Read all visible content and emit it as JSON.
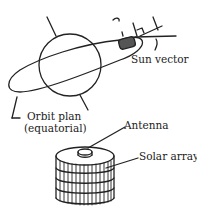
{
  "diagram": {
    "labels": {
      "sun_vector": "Sun vector",
      "orbit_plan_line1": "Orbit plan",
      "orbit_plan_line2": "(equatorial)",
      "antenna": "Antenna",
      "solar_array": "Solar array"
    },
    "colors": {
      "stroke": "#222222",
      "background": "#ffffff"
    }
  }
}
